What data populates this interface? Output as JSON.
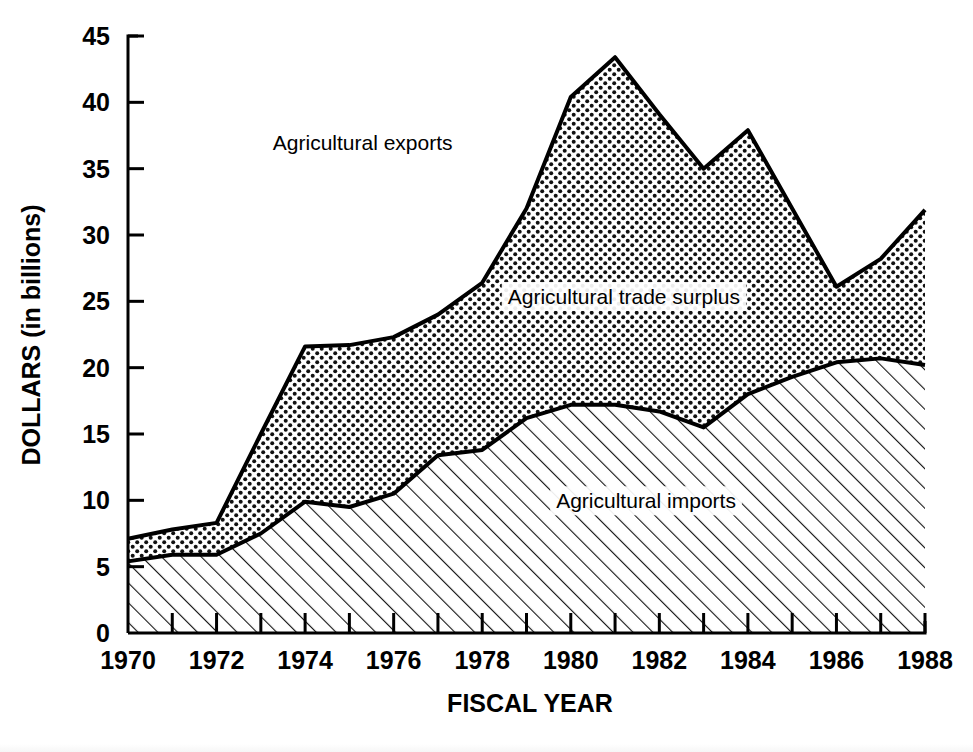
{
  "chart_data": {
    "type": "area",
    "stacked": true,
    "title": "",
    "subtitle": "",
    "xlabel": "FISCAL YEAR",
    "ylabel": "DOLLARS (in billions)",
    "xlim": [
      1970,
      1988
    ],
    "ylim": [
      0,
      45
    ],
    "yticks": [
      0,
      5,
      10,
      15,
      20,
      25,
      30,
      35,
      40,
      45
    ],
    "ytick_labels": [
      "0",
      "5",
      "10",
      "15",
      "20",
      "25",
      "30",
      "35",
      "40",
      "45"
    ],
    "xticks": [
      1970,
      1971,
      1972,
      1973,
      1974,
      1975,
      1976,
      1977,
      1978,
      1979,
      1980,
      1981,
      1982,
      1983,
      1984,
      1985,
      1986,
      1987,
      1988
    ],
    "xtick_labels_shown": [
      "1970",
      "1972",
      "1974",
      "1976",
      "1978",
      "1980",
      "1982",
      "1984",
      "1986",
      "1988"
    ],
    "grid": false,
    "legend_position": "inside-annotations",
    "x": [
      1970,
      1971,
      1972,
      1973,
      1974,
      1975,
      1976,
      1977,
      1978,
      1979,
      1980,
      1981,
      1982,
      1983,
      1984,
      1985,
      1986,
      1987,
      1988
    ],
    "series": [
      {
        "name": "Agricultural imports",
        "fill": "diagonal-hatch",
        "values": [
          5.4,
          5.9,
          5.9,
          7.5,
          9.9,
          9.5,
          10.5,
          13.4,
          13.8,
          16.2,
          17.2,
          17.2,
          16.7,
          15.5,
          18.0,
          19.3,
          20.4,
          20.7,
          20.2
        ]
      },
      {
        "name": "Agricultural exports",
        "fill": "dot-stipple",
        "values": [
          7.1,
          7.8,
          8.3,
          15.0,
          21.6,
          21.7,
          22.3,
          24.0,
          26.4,
          32.0,
          40.4,
          43.4,
          39.1,
          35.0,
          37.9,
          32.0,
          26.1,
          28.2,
          31.9
        ]
      }
    ],
    "derived_series": {
      "name": "Agricultural trade surplus",
      "description": "band between imports and exports",
      "values": [
        1.7,
        1.9,
        2.4,
        7.5,
        11.7,
        12.2,
        11.8,
        10.6,
        12.6,
        15.8,
        23.2,
        26.2,
        22.4,
        19.5,
        19.9,
        12.7,
        5.7,
        7.5,
        11.7
      ]
    },
    "annotations": [
      {
        "text": "Agricultural exports",
        "x": 1975.3,
        "y": 36.4
      },
      {
        "text": "Agricultural trade surplus",
        "x": 1981.2,
        "y": 24.8
      },
      {
        "text": "Agricultural imports",
        "x": 1981.7,
        "y": 9.4
      }
    ]
  },
  "axis": {
    "y_title": "DOLLARS (in billions)",
    "x_title": "FISCAL YEAR"
  },
  "colors": {
    "background": "#ffffff",
    "ink": "#000000",
    "imports_fill": "#ffffff",
    "surplus_fill": "#ffffff"
  }
}
